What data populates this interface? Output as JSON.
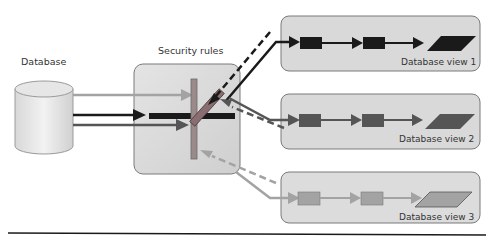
{
  "diagram": {
    "database": {
      "label": "Database"
    },
    "security": {
      "label": "Security rules"
    },
    "views": [
      {
        "label": "Database view 1",
        "shade": "#1a1a1a"
      },
      {
        "label": "Database view 2",
        "shade": "#555555"
      },
      {
        "label": "Database view 3",
        "shade": "#999999"
      }
    ],
    "colors": {
      "dark": "#1a1a1a",
      "mid": "#555555",
      "light": "#a3a3a3",
      "box_fill": "#d9d9d9",
      "box_stroke": "#6e6e6e"
    }
  }
}
